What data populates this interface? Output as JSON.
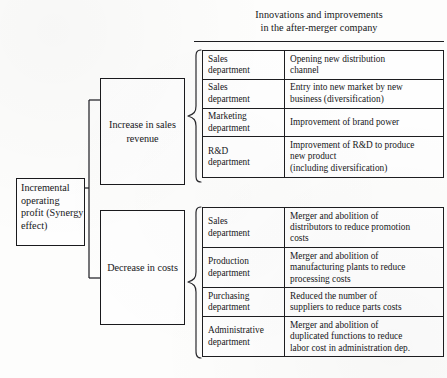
{
  "diagram": {
    "title": {
      "line1": "Innovations and improvements",
      "line2": "in the after-merger company"
    },
    "root_node": {
      "label": "Incremental\noperating\nprofit\n(Synergy\neffect)"
    },
    "branches": [
      {
        "id": "increase-in-sales-revenue",
        "label": "Increase in\nsales revenue",
        "rows": [
          {
            "department": "Sales\ndepartment",
            "description": "Opening new distribution\nchannel"
          },
          {
            "department": "Sales\ndepartment",
            "description": "Entry into new market by new\nbusiness (diversification)"
          },
          {
            "department": "Marketing\ndepartment",
            "description": "Improvement of brand power"
          },
          {
            "department": "R&D\ndepartment",
            "description": "Improvement of R&D to produce\nnew product\n(including diversification)"
          }
        ]
      },
      {
        "id": "decrease-in-costs",
        "label": "Decrease in\ncosts",
        "rows": [
          {
            "department": "Sales\ndepartment",
            "description": "Merger and abolition of\ndistributors to reduce promotion\ncosts"
          },
          {
            "department": "Production\ndepartment",
            "description": "Merger and abolition of\nmanufacturing plants to reduce\nprocessing costs"
          },
          {
            "department": "Purchasing\ndepartment",
            "description": "Reduced the number of\nsuppliers to reduce parts costs"
          },
          {
            "department": "Administrative\ndepartment",
            "description": "Merger and abolition of\nduplicated functions to reduce\nlabor cost in administration dep."
          }
        ]
      }
    ],
    "colors": {
      "ink": "#1a1a1d",
      "page": "#fdfdfc"
    }
  }
}
